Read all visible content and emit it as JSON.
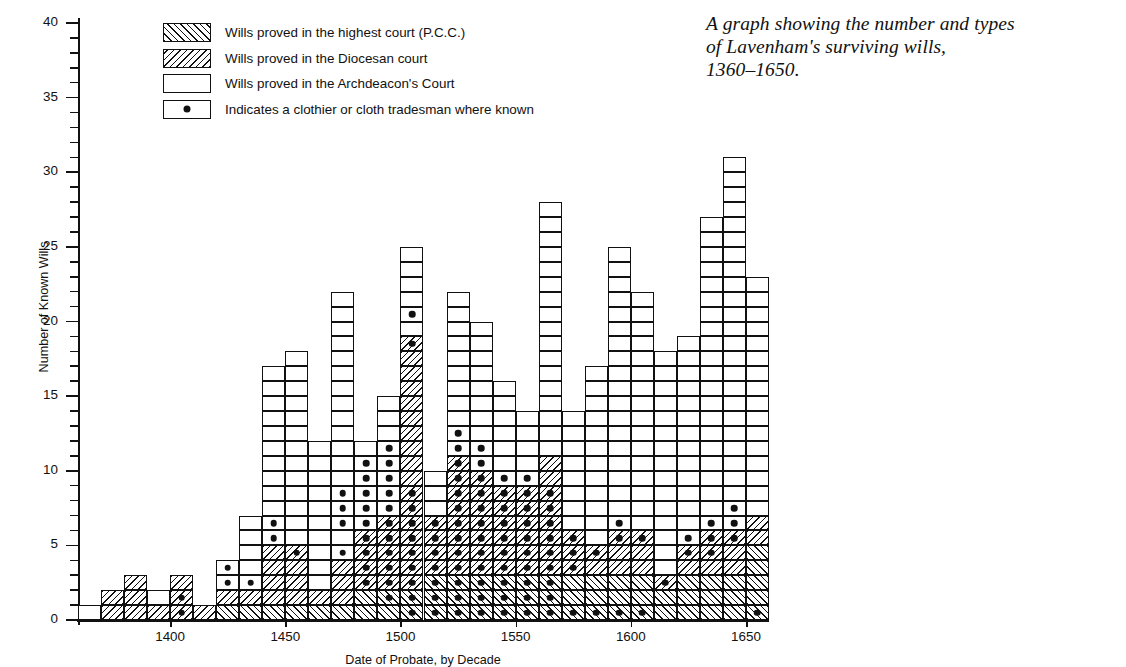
{
  "title": {
    "line1": "A graph showing the number and types",
    "line2": "of Lavenham's surviving wills,",
    "line3": "1360–1650."
  },
  "legend": [
    {
      "key": "pcc",
      "pattern": "hatch-pcc",
      "dot": false,
      "label": "Wills proved in the highest court (P.C.C.)"
    },
    {
      "key": "diocesan",
      "pattern": "hatch-dio",
      "dot": false,
      "label": "Wills proved in the Diocesan court"
    },
    {
      "key": "archdeacon",
      "pattern": "hatch-arch",
      "dot": false,
      "label": "Wills proved in the Archdeacon's Court"
    },
    {
      "key": "clothier",
      "pattern": "hatch-arch",
      "dot": true,
      "label": "Indicates a clothier or cloth tradesman where known"
    }
  ],
  "axes": {
    "y_title": "Number of Known Wills",
    "y_labels": [
      "0",
      "5",
      "10",
      "15",
      "20",
      "25",
      "30",
      "35",
      "40"
    ],
    "y_major_values": [
      0,
      5,
      10,
      15,
      20,
      25,
      30,
      35,
      40
    ],
    "y_minor_values": [
      1,
      2,
      3,
      4,
      6,
      7,
      8,
      9,
      11,
      12,
      13,
      14,
      16,
      17,
      18,
      19,
      21,
      22,
      23,
      24,
      26,
      27,
      28,
      29,
      31,
      32,
      33,
      34,
      36,
      37,
      38,
      39
    ],
    "y_min": 0,
    "y_max": 40,
    "x_title": "Date of Probate, by Decade",
    "x_labels": [
      "1400",
      "1450",
      "1500",
      "1550",
      "1600",
      "1650"
    ],
    "x_label_values": [
      1400,
      1450,
      1500,
      1550,
      1600,
      1650
    ],
    "x_min": 1360,
    "x_max": 1650
  },
  "chart_data": {
    "type": "bar",
    "title": "A graph showing the number and types of Lavenham's surviving wills, 1360–1650.",
    "xlabel": "Date of Probate, by Decade",
    "ylabel": "Number of Known Wills",
    "ylim": [
      0,
      40
    ],
    "xlim": [
      1360,
      1650
    ],
    "grid": false,
    "legend_position": "top-left",
    "stacking_order": [
      "pcc",
      "diocesan",
      "archdeacon"
    ],
    "series": [
      {
        "name": "Wills proved in the highest court (P.C.C.)",
        "key": "pcc",
        "values": [
          0,
          0,
          0,
          0,
          0,
          0,
          1,
          1,
          1,
          1,
          1,
          1,
          2,
          2,
          2,
          2,
          3,
          3,
          3,
          3,
          3,
          3,
          3,
          3,
          3,
          3,
          3,
          3,
          3,
          3
        ]
      },
      {
        "name": "Wills proved in the Diocesan court",
        "key": "diocesan",
        "values": [
          0,
          2,
          3,
          1,
          3,
          1,
          1,
          4,
          4,
          1,
          3,
          4,
          8,
          5,
          6,
          7,
          8,
          8,
          8,
          5,
          5,
          4,
          5,
          4,
          3,
          3,
          4,
          4,
          6,
          5
        ]
      },
      {
        "name": "Wills proved in the Archdeacon's Court",
        "key": "archdeacon",
        "values": [
          1,
          0,
          0,
          1,
          0,
          6,
          15,
          13,
          8,
          10,
          18,
          7,
          5,
          13,
          8,
          5,
          11,
          9,
          17,
          6,
          8,
          9,
          17,
          14,
          15,
          12,
          22,
          20,
          22,
          15
        ]
      }
    ],
    "totals": [
      1,
      2,
      3,
      2,
      3,
      7,
      17,
      18,
      12,
      12,
      22,
      12,
      15,
      20,
      16,
      14,
      22,
      20,
      28,
      14,
      16,
      17,
      25,
      22,
      21,
      18,
      29,
      27,
      31,
      23
    ],
    "bars": [
      {
        "decade": 1360,
        "pcc": 0,
        "diocesan": 0,
        "archdeacon": 1,
        "total": 1,
        "clothier_cells": []
      },
      {
        "decade": 1370,
        "pcc": 0,
        "diocesan": 2,
        "archdeacon": 0,
        "total": 2,
        "clothier_cells": []
      },
      {
        "decade": 1380,
        "pcc": 0,
        "diocesan": 3,
        "archdeacon": 0,
        "total": 3,
        "clothier_cells": []
      },
      {
        "decade": 1390,
        "pcc": 0,
        "diocesan": 1,
        "archdeacon": 1,
        "total": 2,
        "clothier_cells": []
      },
      {
        "decade": 1400,
        "pcc": 0,
        "diocesan": 3,
        "archdeacon": 0,
        "total": 3,
        "clothier_cells": [
          1,
          2
        ]
      },
      {
        "decade": 1410,
        "pcc": 0,
        "diocesan": 1,
        "archdeacon": 0,
        "total": 1,
        "clothier_cells": []
      },
      {
        "decade": 1420,
        "pcc": 1,
        "diocesan": 1,
        "archdeacon": 2,
        "total": 4,
        "clothier_cells": [
          3,
          4
        ]
      },
      {
        "decade": 1430,
        "pcc": 1,
        "diocesan": 1,
        "archdeacon": 5,
        "total": 7,
        "clothier_cells": [
          3
        ]
      },
      {
        "decade": 1440,
        "pcc": 1,
        "diocesan": 4,
        "archdeacon": 12,
        "total": 17,
        "clothier_cells": [
          6,
          7
        ]
      },
      {
        "decade": 1450,
        "pcc": 1,
        "diocesan": 4,
        "archdeacon": 13,
        "total": 18,
        "clothier_cells": [
          5
        ]
      },
      {
        "decade": 1460,
        "pcc": 1,
        "diocesan": 1,
        "archdeacon": 10,
        "total": 12,
        "clothier_cells": []
      },
      {
        "decade": 1470,
        "pcc": 1,
        "diocesan": 3,
        "archdeacon": 18,
        "total": 22,
        "clothier_cells": [
          5,
          7,
          8,
          9
        ]
      },
      {
        "decade": 1480,
        "pcc": 2,
        "diocesan": 4,
        "archdeacon": 6,
        "total": 12,
        "clothier_cells": [
          3,
          4,
          5,
          6,
          7,
          8,
          9,
          10,
          11
        ]
      },
      {
        "decade": 1490,
        "pcc": 2,
        "diocesan": 5,
        "archdeacon": 8,
        "total": 15,
        "clothier_cells": [
          2,
          3,
          4,
          5,
          6,
          7,
          8,
          9,
          10,
          11,
          12
        ]
      },
      {
        "decade": 1500,
        "pcc": 2,
        "diocesan": 17,
        "archdeacon": 6,
        "total": 25,
        "clothier_cells": [
          1,
          2,
          3,
          4,
          5,
          6,
          7,
          8,
          9,
          19,
          21
        ]
      },
      {
        "decade": 1510,
        "pcc": 3,
        "diocesan": 4,
        "archdeacon": 3,
        "total": 10,
        "clothier_cells": [
          1,
          2,
          3,
          4,
          5,
          6,
          7
        ]
      },
      {
        "decade": 1520,
        "pcc": 3,
        "diocesan": 8,
        "archdeacon": 11,
        "total": 22,
        "clothier_cells": [
          1,
          2,
          3,
          4,
          5,
          6,
          7,
          8,
          9,
          10,
          11,
          12,
          13
        ]
      },
      {
        "decade": 1530,
        "pcc": 3,
        "diocesan": 7,
        "archdeacon": 10,
        "total": 20,
        "clothier_cells": [
          1,
          2,
          3,
          4,
          5,
          6,
          7,
          8,
          9,
          10,
          11,
          12
        ]
      },
      {
        "decade": 1540,
        "pcc": 3,
        "diocesan": 6,
        "archdeacon": 7,
        "total": 16,
        "clothier_cells": [
          1,
          2,
          3,
          4,
          5,
          6,
          7,
          8,
          9,
          10
        ]
      },
      {
        "decade": 1550,
        "pcc": 3,
        "diocesan": 6,
        "archdeacon": 5,
        "total": 14,
        "clothier_cells": [
          1,
          2,
          3,
          4,
          5,
          6,
          7,
          8,
          9,
          10
        ]
      },
      {
        "decade": 1560,
        "pcc": 3,
        "diocesan": 8,
        "archdeacon": 17,
        "total": 28,
        "clothier_cells": [
          1,
          2,
          3,
          4,
          5,
          6,
          7,
          8,
          9
        ]
      },
      {
        "decade": 1570,
        "pcc": 3,
        "diocesan": 3,
        "archdeacon": 8,
        "total": 14,
        "clothier_cells": [
          1,
          4,
          5,
          6
        ]
      },
      {
        "decade": 1580,
        "pcc": 3,
        "diocesan": 2,
        "archdeacon": 12,
        "total": 17,
        "clothier_cells": [
          1,
          5
        ]
      },
      {
        "decade": 1590,
        "pcc": 3,
        "diocesan": 3,
        "archdeacon": 19,
        "total": 25,
        "clothier_cells": [
          1,
          6,
          7
        ]
      },
      {
        "decade": 1600,
        "pcc": 3,
        "diocesan": 3,
        "archdeacon": 16,
        "total": 22,
        "clothier_cells": [
          1,
          6
        ]
      },
      {
        "decade": 1610,
        "pcc": 2,
        "diocesan": 1,
        "archdeacon": 15,
        "total": 18,
        "clothier_cells": [
          3
        ]
      },
      {
        "decade": 1620,
        "pcc": 3,
        "diocesan": 2,
        "archdeacon": 14,
        "total": 19,
        "clothier_cells": [
          5,
          6
        ]
      },
      {
        "decade": 1630,
        "pcc": 3,
        "diocesan": 3,
        "archdeacon": 21,
        "total": 27,
        "clothier_cells": [
          5,
          6,
          7
        ]
      },
      {
        "decade": 1640,
        "pcc": 3,
        "diocesan": 3,
        "archdeacon": 25,
        "total": 31,
        "clothier_cells": [
          6,
          7,
          8
        ]
      },
      {
        "decade": 1650,
        "pcc": 5,
        "diocesan": 2,
        "archdeacon": 16,
        "total": 23,
        "clothier_cells": [
          1
        ]
      }
    ]
  }
}
